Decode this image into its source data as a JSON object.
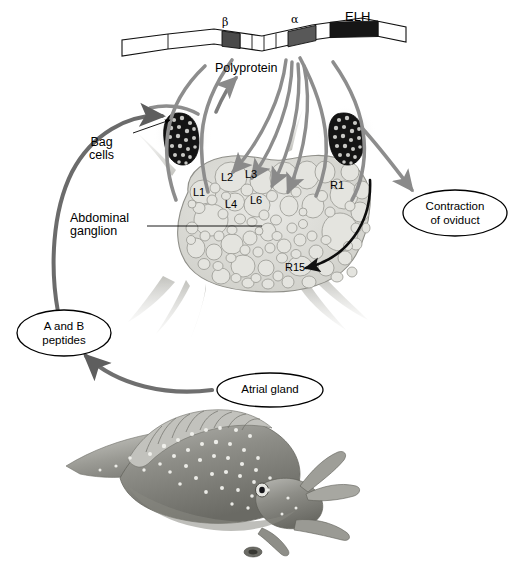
{
  "figure": {
    "organism": "Aplysia (sea hare)"
  },
  "polyprotein": {
    "label": "Polyprotein",
    "segments": [
      {
        "name": "beta",
        "label": "β",
        "color": "#4a4a4a"
      },
      {
        "name": "alpha",
        "label": "α",
        "color": "#5a5a5a"
      },
      {
        "name": "elh",
        "label": "ELH",
        "color": "#1a1a1a"
      }
    ]
  },
  "anatomy": {
    "bag_cells_label": "Bag\ncells",
    "ganglion_label": "Abdominal\nganglion"
  },
  "neurons": [
    {
      "id": "L1",
      "label": "L1"
    },
    {
      "id": "L2",
      "label": "L2"
    },
    {
      "id": "L3",
      "label": "L3"
    },
    {
      "id": "L4",
      "label": "L4"
    },
    {
      "id": "L6",
      "label": "L6"
    },
    {
      "id": "R1",
      "label": "R1"
    },
    {
      "id": "R15",
      "label": "R15"
    }
  ],
  "callouts": [
    {
      "id": "contraction",
      "label": "Contraction\nof oviduct"
    },
    {
      "id": "peptides",
      "label": "A and B\npeptides"
    },
    {
      "id": "atrial",
      "label": "Atrial gland"
    }
  ],
  "colors": {
    "nerve_gray": "#8a8a8a",
    "dark_arrow": "#606060",
    "black": "#000000",
    "ganglion_fill": "#d9d9d4",
    "cell_fill": "#e2e2dd",
    "cell_stroke": "#9a9a94",
    "bagcell_dark": "#1c1c1c"
  }
}
